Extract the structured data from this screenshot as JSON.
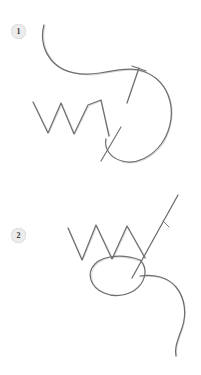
{
  "document": {
    "title": "Stitch Diagram",
    "kind": "instructional-line-drawing",
    "background_color": "#ffffff",
    "line_color": "#6e6e72",
    "badge_fill_color": "#ececed",
    "badge_text_color": "#3b3b3b",
    "width_px": 201,
    "height_px": 375
  },
  "steps": [
    {
      "number": "1",
      "badge_label": "1",
      "caption": "",
      "elements": [
        {
          "name": "thread-curve",
          "description": "long thread curving from upper-left down to the right"
        },
        {
          "name": "thread-loop",
          "description": "large rounded loop on the right side"
        },
        {
          "name": "zigzag-stitch",
          "description": "zigzag stitch line across the middle-left"
        },
        {
          "name": "needle",
          "description": "needle crossing the thread at the right"
        },
        {
          "name": "needle-tail",
          "description": "short thread tail crossing near the lower middle"
        }
      ]
    },
    {
      "number": "2",
      "badge_label": "2",
      "caption": "",
      "elements": [
        {
          "name": "zigzag-stitch",
          "description": "zigzag stitch line across the upper middle"
        },
        {
          "name": "thread-loop",
          "description": "tilted oval loop below the zigzag"
        },
        {
          "name": "needle",
          "description": "needle angled up to the right through the loop"
        },
        {
          "name": "thread-tail",
          "description": "thread tail curving down to the lower right"
        }
      ]
    }
  ]
}
